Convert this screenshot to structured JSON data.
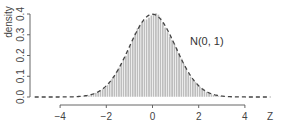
{
  "chart_data": {
    "type": "bar",
    "subtype": "histogram-with-density-overlay",
    "title": "",
    "xlabel": "Z",
    "ylabel": "density",
    "xlim": [
      -4,
      4
    ],
    "ylim": [
      0.0,
      0.4
    ],
    "x_ticks": [
      -4,
      -2,
      0,
      2,
      4
    ],
    "x_tick_labels": [
      "−4",
      "−2",
      "0",
      "2",
      "4"
    ],
    "y_ticks": [
      0.0,
      0.1,
      0.2,
      0.3,
      0.4
    ],
    "y_tick_labels": [
      "0.0",
      "0.1",
      "0.2",
      "0.3",
      "0.4"
    ],
    "grid": false,
    "annotation": "N(0, 1)",
    "series": [
      {
        "name": "histogram",
        "kind": "bar",
        "bin_width": 0.1,
        "bin_range": [
          -3.2,
          3.2
        ],
        "color": "#bdbdbd",
        "edge_color": "#ffffff",
        "description": "Histogram of simulated standardized values approximating a standard normal density"
      },
      {
        "name": "N(0, 1)",
        "kind": "line",
        "style": "dashed",
        "color": "#444444",
        "function": "standard normal density",
        "x_range": [
          -4.2,
          4.2
        ],
        "peak": {
          "x": 0,
          "y": 0.399
        }
      }
    ],
    "colors": {
      "bars": "#bdbdbd",
      "curve": "#444444",
      "axis": "#666666"
    }
  }
}
